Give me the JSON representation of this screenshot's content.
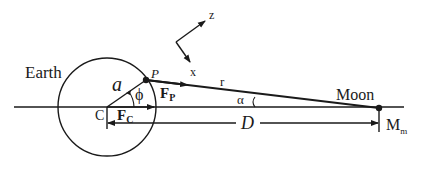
{
  "diagram": {
    "labels": {
      "earth": "Earth",
      "moon": "Moon",
      "center": "C",
      "point_p": "P",
      "radius": "a",
      "angle_phi": "ϕ",
      "angle_alpha": "α",
      "distance_r": "r",
      "distance_D": "D",
      "force_p_main": "F",
      "force_p_sub": "P",
      "force_c_main": "F",
      "force_c_sub": "C",
      "moon_mass_main": "M",
      "moon_mass_sub": "m",
      "axis_z": "z",
      "axis_x": "x"
    },
    "colors": {
      "stroke": "#1a1a1a",
      "background": "#ffffff"
    }
  }
}
